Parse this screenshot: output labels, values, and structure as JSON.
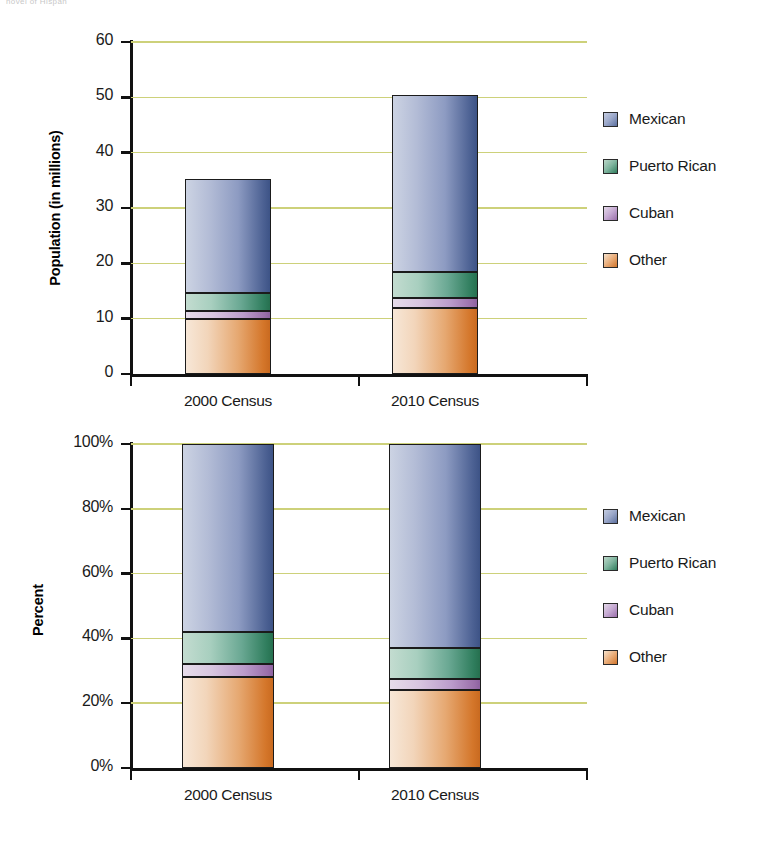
{
  "page": {
    "bleed_text": "hovel of Hispan"
  },
  "colors": {
    "mexican": "#6b7fae",
    "puerto_rican": "#3d8a6b",
    "cuban": "#a87bb5",
    "other": "#d9823a",
    "gridline": "#cdd17a",
    "axis": "#111111"
  },
  "legend": {
    "items": [
      {
        "key": "mexican",
        "label": "Mexican"
      },
      {
        "key": "puertorican",
        "label": "Puerto Rican"
      },
      {
        "key": "cuban",
        "label": "Cuban"
      },
      {
        "key": "other",
        "label": "Other"
      }
    ]
  },
  "chart_data": [
    {
      "id": "population",
      "type": "bar",
      "stacked": true,
      "title": "",
      "xlabel": "",
      "ylabel": "Population (in millions)",
      "ylim": [
        0,
        60
      ],
      "yticks": [
        0,
        10,
        20,
        30,
        40,
        50,
        60
      ],
      "ytick_labels": [
        "0",
        "10",
        "20",
        "30",
        "40",
        "50",
        "60"
      ],
      "grid": true,
      "legend_position": "right",
      "categories": [
        "2000 Census",
        "2010 Census"
      ],
      "series": [
        {
          "name": "Other",
          "values": [
            10.0,
            12.0
          ]
        },
        {
          "name": "Cuban",
          "values": [
            1.3,
            1.8
          ]
        },
        {
          "name": "Puerto Rican",
          "values": [
            3.4,
            4.6
          ]
        },
        {
          "name": "Mexican",
          "values": [
            20.6,
            32.1
          ]
        }
      ],
      "totals": [
        35.3,
        50.5
      ]
    },
    {
      "id": "percent",
      "type": "bar",
      "stacked": true,
      "title": "",
      "xlabel": "",
      "ylabel": "Percent",
      "ylim": [
        0,
        100
      ],
      "yticks": [
        0,
        20,
        40,
        60,
        80,
        100
      ],
      "ytick_labels": [
        "0%",
        "20%",
        "40%",
        "60%",
        "80%",
        "100%"
      ],
      "grid": true,
      "legend_position": "right",
      "categories": [
        "2000 Census",
        "2010 Census"
      ],
      "series": [
        {
          "name": "Other",
          "values": [
            28.0,
            24.0
          ]
        },
        {
          "name": "Cuban",
          "values": [
            4.0,
            3.5
          ]
        },
        {
          "name": "Puerto Rican",
          "values": [
            10.0,
            9.5
          ]
        },
        {
          "name": "Mexican",
          "values": [
            58.0,
            63.0
          ]
        }
      ],
      "totals": [
        100,
        100
      ]
    }
  ]
}
